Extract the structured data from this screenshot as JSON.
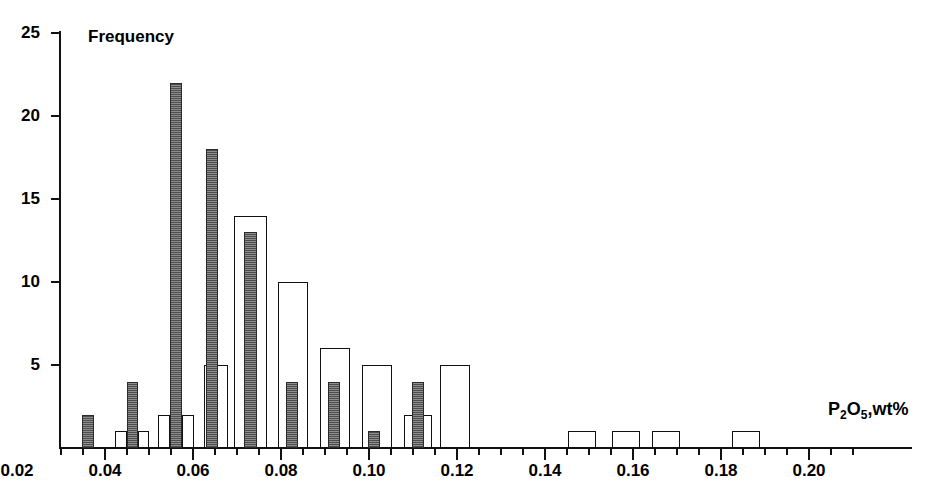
{
  "chart_data": {
    "type": "bar",
    "title": "",
    "subtitle": "",
    "xlabel": "P2O5,wt%",
    "ylabel": "Frequency",
    "xlim": [
      0.0,
      0.21
    ],
    "ylim": [
      0,
      25
    ],
    "grid": false,
    "legend_position": "none",
    "bin_width": 0.005,
    "x_major_ticks": [
      0.02,
      0.04,
      0.06,
      0.08,
      0.1,
      0.12,
      0.14,
      0.16,
      0.18,
      0.2
    ],
    "x_major_tick_labels": [
      "0.02",
      "0.04",
      "0.06",
      "0.08",
      "0.10",
      "0.12",
      "0.14",
      "0.16",
      "0.18",
      "0.20"
    ],
    "x_minor_tick_step": 0.005,
    "y_ticks": [
      5,
      10,
      15,
      20,
      25
    ],
    "y_tick_labels": [
      "5",
      "10",
      "15",
      "20",
      "25"
    ],
    "series": [
      {
        "name": "filled",
        "style": "filled-grey",
        "bins": [
          {
            "x": 0.0075,
            "value": 2
          },
          {
            "x": 0.0175,
            "value": 4
          },
          {
            "x": 0.0275,
            "value": 22
          },
          {
            "x": 0.0375,
            "value": 18
          },
          {
            "x": 0.0425,
            "value": 5
          },
          {
            "x": 0.0475,
            "value": 13
          },
          {
            "x": 0.0575,
            "value": 4
          },
          {
            "x": 0.0675,
            "value": 4
          },
          {
            "x": 0.0775,
            "value": 1
          },
          {
            "x": 0.0875,
            "value": 4
          }
        ]
      },
      {
        "name": "open",
        "style": "open-outline",
        "bins": [
          {
            "x": 0.0125,
            "value": 1
          },
          {
            "x": 0.0225,
            "value": 1
          },
          {
            "x": 0.0325,
            "value": 2
          },
          {
            "x": 0.0275,
            "value": 2
          },
          {
            "x": 0.0425,
            "value": 2
          },
          {
            "x": 0.0475,
            "value": 14
          },
          {
            "x": 0.0525,
            "value": 14
          },
          {
            "x": 0.0575,
            "value": 10
          },
          {
            "x": 0.0675,
            "value": 6
          },
          {
            "x": 0.0775,
            "value": 5
          },
          {
            "x": 0.0875,
            "value": 2
          },
          {
            "x": 0.0925,
            "value": 5
          },
          {
            "x": 0.1275,
            "value": 1
          },
          {
            "x": 0.1375,
            "value": 1
          },
          {
            "x": 0.1475,
            "value": 1
          },
          {
            "x": 0.1675,
            "value": 1
          }
        ]
      }
    ],
    "bars_rendered": [
      {
        "id": "b01",
        "kind": "filled",
        "left": 82,
        "width": 12,
        "value": 2,
        "x": 0.0075
      },
      {
        "id": "b02",
        "kind": "open",
        "left": 115,
        "width": 12,
        "value": 1,
        "x": 0.0125
      },
      {
        "id": "b03",
        "kind": "filled",
        "left": 127,
        "width": 11,
        "value": 4,
        "x": 0.0175
      },
      {
        "id": "b04",
        "kind": "open",
        "left": 138,
        "width": 11,
        "value": 1,
        "x": 0.0225
      },
      {
        "id": "b05",
        "kind": "open",
        "left": 158,
        "width": 12,
        "value": 2,
        "x": 0.0275
      },
      {
        "id": "b06",
        "kind": "filled",
        "left": 170,
        "width": 12,
        "value": 22,
        "x": 0.0275
      },
      {
        "id": "b07",
        "kind": "open",
        "left": 182,
        "width": 12,
        "value": 2,
        "x": 0.0325
      },
      {
        "id": "b08",
        "kind": "open",
        "left": 204,
        "width": 12,
        "value": 5,
        "x": 0.0375
      },
      {
        "id": "b09",
        "kind": "filled",
        "left": 206,
        "width": 12,
        "value": 18,
        "x": 0.0375
      },
      {
        "id": "b10",
        "kind": "open",
        "left": 216,
        "width": 12,
        "value": 5,
        "x": 0.0425
      },
      {
        "id": "b11",
        "kind": "open",
        "left": 234,
        "width": 33,
        "value": 14,
        "x": 0.0475
      },
      {
        "id": "b12",
        "kind": "filled",
        "left": 244,
        "width": 13,
        "value": 13,
        "x": 0.0475
      },
      {
        "id": "b13",
        "kind": "open",
        "left": 278,
        "width": 30,
        "value": 10,
        "x": 0.0575
      },
      {
        "id": "b14",
        "kind": "filled",
        "left": 286,
        "width": 12,
        "value": 4,
        "x": 0.0575
      },
      {
        "id": "b15",
        "kind": "open",
        "left": 320,
        "width": 30,
        "value": 6,
        "x": 0.0675
      },
      {
        "id": "b16",
        "kind": "filled",
        "left": 328,
        "width": 12,
        "value": 4,
        "x": 0.0675
      },
      {
        "id": "b17",
        "kind": "filled",
        "left": 368,
        "width": 12,
        "value": 1,
        "x": 0.0775
      },
      {
        "id": "b18",
        "kind": "open",
        "left": 362,
        "width": 30,
        "value": 5,
        "x": 0.0775
      },
      {
        "id": "b19",
        "kind": "open",
        "left": 404,
        "width": 28,
        "value": 2,
        "x": 0.0875
      },
      {
        "id": "b20",
        "kind": "filled",
        "left": 412,
        "width": 12,
        "value": 4,
        "x": 0.0875
      },
      {
        "id": "b21",
        "kind": "open",
        "left": 440,
        "width": 30,
        "value": 5,
        "x": 0.0925
      },
      {
        "id": "b22",
        "kind": "open",
        "left": 568,
        "width": 28,
        "value": 1,
        "x": 0.1275
      },
      {
        "id": "b23",
        "kind": "open",
        "left": 612,
        "width": 28,
        "value": 1,
        "x": 0.1375
      },
      {
        "id": "b24",
        "kind": "open",
        "left": 652,
        "width": 28,
        "value": 1,
        "x": 0.1475
      },
      {
        "id": "b25",
        "kind": "open",
        "left": 732,
        "width": 28,
        "value": 1,
        "x": 0.1675
      }
    ]
  },
  "labels": {
    "frequency": "Frequency",
    "x_axis_p": "P",
    "x_axis_sub2": "2",
    "x_axis_o": "O",
    "x_axis_sub5": "5",
    "x_axis_unit": ",wt%"
  },
  "colors": {
    "axis": "#111111",
    "filled_bar": "#6e6e6e",
    "open_bar": "#ffffff",
    "background": "#ffffff"
  }
}
